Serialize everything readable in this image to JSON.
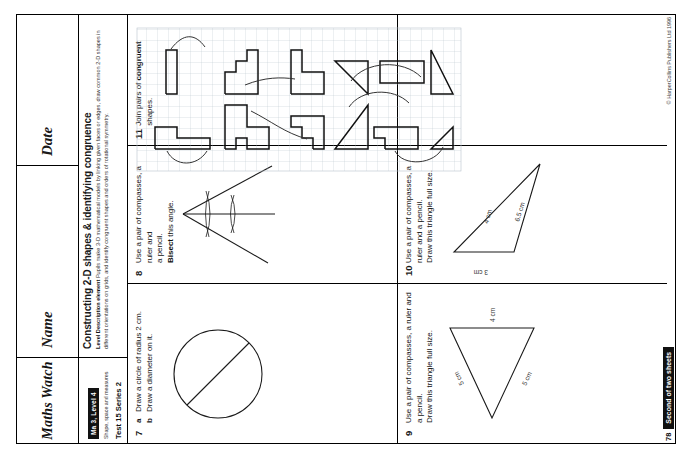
{
  "header": {
    "logo": "Maths Watch",
    "name_label": "Name",
    "date_label": "Date"
  },
  "meta": {
    "badge": "Ma 3, Level 4",
    "attainment": "Shape, space and measures",
    "test_line": "Test 15  Series 2",
    "title": "Constructing 2-D shapes & identifying congruence",
    "description_lead": "Level Description element",
    "description": "Pupils make 3-D mathematical models by linking given faces or edges, draw common 2-D shapes in different orientations on grids, and identify congruent shapes and orders of rotational symmetry."
  },
  "questions": [
    {
      "number": "7",
      "text": "",
      "parts": [
        {
          "label": "a",
          "text": "Draw a circle of radius 2 cm."
        },
        {
          "label": "b",
          "text": "Draw a diameter on it."
        }
      ]
    },
    {
      "number": "8",
      "line1": "Use a pair of compasses, a ruler and",
      "line2": "a pencil.",
      "line3_bold": "Bisect",
      "line3_rest": " this angle."
    },
    {
      "number": "9",
      "line1": "Use a pair of compasses, a ruler and a pencil.",
      "line2": "Draw this triangle full size.",
      "dims": [
        {
          "value": "5 cm"
        },
        {
          "value": "5 cm"
        },
        {
          "value": "4 cm"
        }
      ]
    },
    {
      "number": "10",
      "line1": "Use a pair of compasses, a ruler and a pencil.",
      "line2": "Draw this triangle full size.",
      "dims": [
        {
          "value": "3 cm"
        },
        {
          "value": "4 cm"
        },
        {
          "value": "6.5 cm"
        }
      ]
    },
    {
      "number": "11",
      "text_pre": "Join pairs of ",
      "text_bold": "congruent",
      "text_post": " shapes."
    }
  ],
  "footer": {
    "page_number": "78",
    "sheet_badge": "Second of two sheets",
    "copyright": "© HarperCollins Publishers Ltd 1996"
  },
  "colors": {
    "ink": "#1a1a1a",
    "badge_bg": "#111111",
    "badge_fg": "#ffffff",
    "grid": "#b9c2cc"
  }
}
